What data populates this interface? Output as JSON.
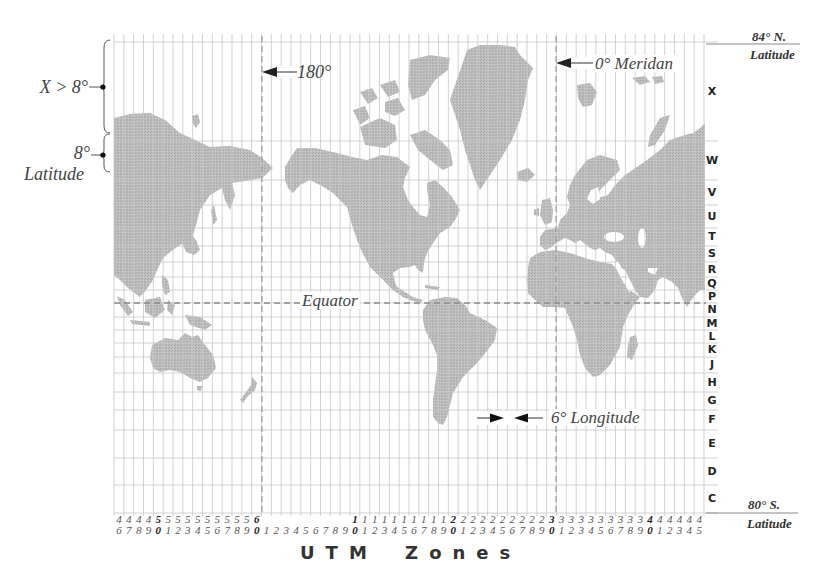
{
  "left_annotations": {
    "band_x_label": "X > 8°",
    "band_8_label": "8°",
    "band_8_sub": "Latitude"
  },
  "map_labels": {
    "antimeridian": "180°",
    "prime_meridian": "0° Meridan",
    "equator": "Equator",
    "zone_width": "6° Longitude"
  },
  "right_labels": {
    "north_limit": "84° N.",
    "north_sub": "Latitude",
    "south_limit": "80° S.",
    "south_sub": "Latitude"
  },
  "latitude_bands": [
    "X",
    "W",
    "V",
    "U",
    "T",
    "S",
    "R",
    "Q",
    "P",
    "N",
    "M",
    "L",
    "K",
    "J",
    "H",
    "G",
    "F",
    "E",
    "D",
    "C"
  ],
  "utm_zones": [
    46,
    47,
    48,
    49,
    50,
    51,
    52,
    53,
    54,
    55,
    56,
    57,
    58,
    59,
    60,
    1,
    2,
    3,
    4,
    5,
    6,
    7,
    8,
    9,
    10,
    11,
    12,
    13,
    14,
    15,
    16,
    17,
    18,
    19,
    20,
    21,
    22,
    23,
    24,
    25,
    26,
    27,
    28,
    29,
    30,
    31,
    32,
    33,
    34,
    35,
    36,
    37,
    38,
    39,
    40,
    41,
    42,
    43,
    44,
    45
  ],
  "x_axis_label": "UTM Zones",
  "colors": {
    "land": "#b9b9b9",
    "grid": "#c6c6c6",
    "dashed": "#8a8a8a",
    "text": "#333333"
  }
}
